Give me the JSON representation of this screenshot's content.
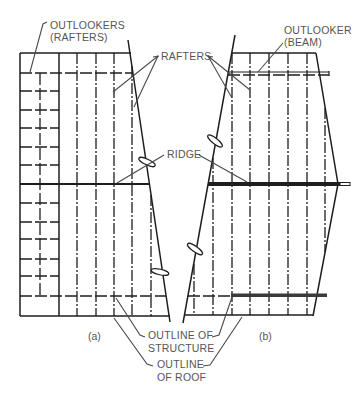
{
  "figure": {
    "panel_a": {
      "caption": "(a)"
    },
    "panel_b": {
      "caption": "(b)"
    }
  },
  "labels": {
    "outlookers_rafters": {
      "line1": "OUTLOOKERS",
      "line2": "(RAFTERS)"
    },
    "rafters": "RAFTERS",
    "outlooker_beam": {
      "line1": "OUTLOOKER",
      "line2": "(BEAM)"
    },
    "ridge": "RIDGE",
    "outline_structure": {
      "line1": "OUTLINE OF",
      "line2": "STRUCTURE"
    },
    "outline_roof": {
      "line1": "OUTLINE",
      "line2": "OF ROOF"
    }
  },
  "colors": {
    "line": "#1e1e1e",
    "text": "#555555",
    "background": "#ffffff"
  }
}
